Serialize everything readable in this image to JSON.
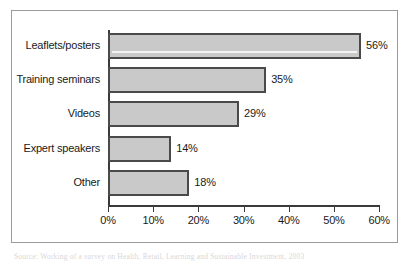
{
  "chart_data": {
    "type": "bar",
    "orientation": "horizontal",
    "title": "",
    "subtitle": "",
    "xlabel": "",
    "ylabel": "",
    "categories": [
      "Leaflets/posters",
      "Training seminars",
      "Videos",
      "Expert speakers",
      "Other"
    ],
    "values": [
      56,
      35,
      29,
      14,
      18
    ],
    "value_labels": [
      "56%",
      "35%",
      "29%",
      "14%",
      "18%"
    ],
    "xlim": [
      0,
      60
    ],
    "xticks": [
      0,
      10,
      20,
      30,
      40,
      50,
      60
    ],
    "xtick_labels": [
      "0%",
      "10%",
      "20%",
      "30%",
      "40%",
      "50%",
      "60%"
    ],
    "grid": false,
    "legend": null,
    "legend_position": "none",
    "bar_fill_color": "#c9c9c9",
    "bar_border_color": "#4a4a4a",
    "axis_color": "#3a3a3a",
    "frame_color": "#9a9a9a",
    "text_color": "#1a1a1a"
  },
  "caption": {
    "text": "Source: Working of a survey on Health, Retail, Learning and Sustainable Investment, 2003"
  }
}
